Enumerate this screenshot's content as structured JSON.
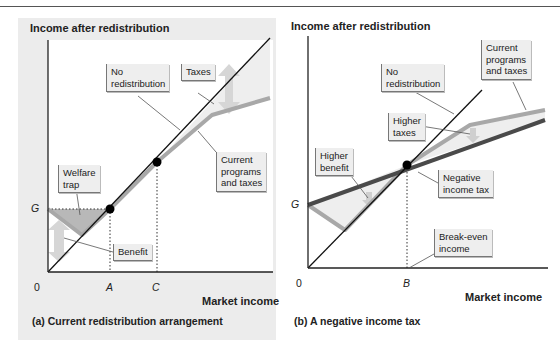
{
  "colors": {
    "panel_bg": "#ececec",
    "plot_bg": "#ffffff",
    "no_redistribution_line": "#111111",
    "current_programs_line": "#a8a8a8",
    "negative_income_tax_line": "#4a4a4a",
    "welfare_trap_fill": "#b8b8b8",
    "arrow_fill": "#d8d8d8",
    "point": "#000000"
  },
  "panel_a": {
    "y_axis_title": "Income after redistribution",
    "x_axis_title": "Market income",
    "caption": "(a)  Current redistribution arrangement",
    "ticks": {
      "origin": "0",
      "y_G": "G",
      "x_A": "A",
      "x_C": "C"
    },
    "callouts": {
      "no_redistribution": "No\nredistribution",
      "taxes": "Taxes",
      "current_programs": "Current\nprograms\nand taxes",
      "welfare_trap": "Welfare\ntrap",
      "benefit": "Benefit"
    }
  },
  "panel_b": {
    "y_axis_title": "Income after redistribution",
    "x_axis_title": "Market income",
    "caption": "(b)  A negative income tax",
    "ticks": {
      "origin": "0",
      "y_G": "G",
      "x_B": "B"
    },
    "callouts": {
      "no_redistribution": "No\nredistribution",
      "current_programs": "Current\nprograms\nand taxes",
      "higher_taxes": "Higher\ntaxes",
      "higher_benefit": "Higher\nbenefit",
      "negative_income_tax": "Negative\nincome tax",
      "break_even_income": "Break-even\nincome"
    }
  }
}
